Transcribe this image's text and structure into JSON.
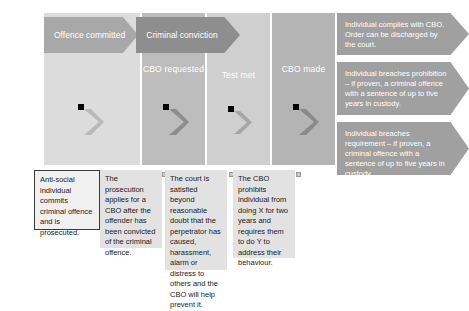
{
  "diagram": {
    "colors": {
      "stage_1": "#dcdcdc",
      "stage_2": "#bdbdbd",
      "stage_3": "#cfcfcf",
      "stage_4": "#b4b4b4",
      "banner_offence": "#a8a8a8",
      "banner_conviction": "#8e8e8e",
      "outcome_arrow": "#a0a0a0",
      "note_background": "#e2e2e2",
      "note_border": "#3a3a3a",
      "banner_text": "#ffffff"
    },
    "banners": [
      {
        "id": "offence-committed",
        "label": "Offence committed"
      },
      {
        "id": "criminal-conviction",
        "label": "Criminal conviction"
      }
    ],
    "stages": [
      {
        "id": "offence",
        "label": ""
      },
      {
        "id": "cbo-requested",
        "label": "CBO requested"
      },
      {
        "id": "test-met",
        "label": "Test met"
      },
      {
        "id": "cbo-made",
        "label": "CBO made"
      }
    ],
    "notes": [
      {
        "id": "note-prosecution-start",
        "text": "Anti-social individual commits criminal offence and is prosecuted."
      },
      {
        "id": "note-cbo-application",
        "text": "The prosecution applies for a CBO after the offender has been convicted of the criminal offence."
      },
      {
        "id": "note-court-test",
        "text": "The court is satisfied beyond reasonable doubt that the perpetrator has caused, harassment, alarm or distress to others and the CBO will help prevent it."
      },
      {
        "id": "note-cbo-terms",
        "text": "The CBO prohibits individual from doing X for two years and requires them to do Y to address their behaviour."
      }
    ],
    "outcomes": [
      {
        "id": "outcome-compliance",
        "text": "Individual complies with CBO. Order can be discharged by the court."
      },
      {
        "id": "outcome-breach-prohibition",
        "text": "Individual breaches prohibition – if proven, a criminal offence with a sentence of up to five years in custody."
      },
      {
        "id": "outcome-breach-requirement",
        "text": "Individual breaches requirement – if proven, a criminal offence with a sentence of up to five years in custody."
      }
    ]
  }
}
